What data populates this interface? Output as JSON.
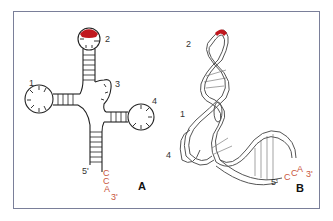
{
  "figure": {
    "panels": [
      {
        "id": "A",
        "label": "A",
        "kind": "cloverleaf secondary structure",
        "arm_labels": [
          "1",
          "2",
          "3",
          "4"
        ],
        "five_prime": "5'",
        "three_prime_seq": [
          "C",
          "C",
          "A"
        ],
        "three_prime": "3'"
      },
      {
        "id": "B",
        "label": "B",
        "kind": "L-shaped tertiary structure",
        "arm_labels": [
          "2",
          "1",
          "4"
        ],
        "five_prime": "5'",
        "three_prime_seq": [
          "C",
          "C",
          "A"
        ],
        "three_prime": "3'"
      }
    ],
    "colors": {
      "frame": "#7a7f99",
      "line": "#222222",
      "anticodon": "#c0181f",
      "cca": "#c8553d",
      "ribbon_edge": "#555555"
    }
  }
}
